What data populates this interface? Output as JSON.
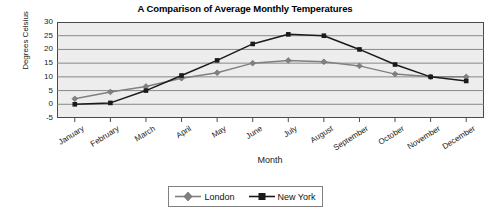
{
  "chart_data": {
    "type": "line",
    "title": "A Comparison of Average Monthly Temperatures",
    "xlabel": "Month",
    "ylabel": "Degrees Celsius",
    "categories": [
      "January",
      "February",
      "March",
      "April",
      "May",
      "June",
      "July",
      "August",
      "September",
      "October",
      "November",
      "December"
    ],
    "yticks": [
      30,
      25,
      20,
      15,
      10,
      5,
      0,
      -5
    ],
    "ylim": [
      -5,
      30
    ],
    "grid": "horizontal",
    "legend_position": "bottom-center",
    "series": [
      {
        "name": "London",
        "color": "#808080",
        "marker": "diamond",
        "values": [
          2,
          4.5,
          6.5,
          9.5,
          11.5,
          15,
          16,
          15.5,
          14,
          11,
          10,
          10
        ]
      },
      {
        "name": "New York",
        "color": "#1a1a1a",
        "marker": "square",
        "values": [
          0,
          0.5,
          5,
          10.5,
          16,
          22,
          25.5,
          25,
          20,
          14.5,
          10,
          8.5
        ]
      }
    ]
  },
  "legend": {
    "items": [
      {
        "label": "London"
      },
      {
        "label": "New York"
      }
    ]
  }
}
